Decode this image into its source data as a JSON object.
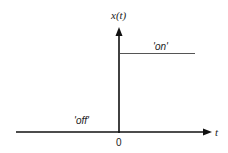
{
  "diagram": {
    "type": "unit-step-signal",
    "y_axis_label": "x(t)",
    "x_axis_label": "t",
    "origin_label": "0",
    "state_on_label": "'on'",
    "state_off_label": "'off'",
    "colors": {
      "axis": "#111111",
      "signal": "#555555",
      "text": "#222222",
      "background": "#ffffff"
    }
  }
}
